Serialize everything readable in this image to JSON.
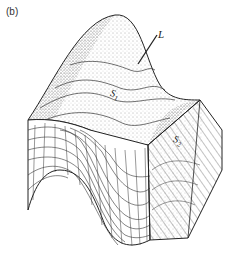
{
  "figure": {
    "panel_label": "(b)",
    "labels": {
      "hinge_line": "L",
      "surface_1": "S",
      "surface_1_sub": "1",
      "surface_2": "S",
      "surface_2_sub": "2"
    }
  },
  "colors": {
    "ink": "#222222",
    "stipple": "#555555",
    "background": "#ffffff"
  }
}
